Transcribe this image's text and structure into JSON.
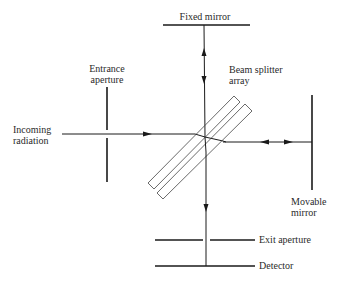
{
  "diagram": {
    "type": "Michelson interferometer schematic",
    "labels": {
      "fixed_mirror": "Fixed mirror",
      "entrance_aperture_line1": "Entrance",
      "entrance_aperture_line2": "aperture",
      "beam_splitter_line1": "Beam splitter",
      "beam_splitter_line2": "array",
      "incoming_line1": "Incoming",
      "incoming_line2": "radiation",
      "movable_mirror_line1": "Movable",
      "movable_mirror_line2": "mirror",
      "exit_aperture": "Exit aperture",
      "detector": "Detector"
    },
    "colors": {
      "line": "#1a1a1a",
      "text": "#2a2a2a",
      "background": "#ffffff"
    }
  }
}
